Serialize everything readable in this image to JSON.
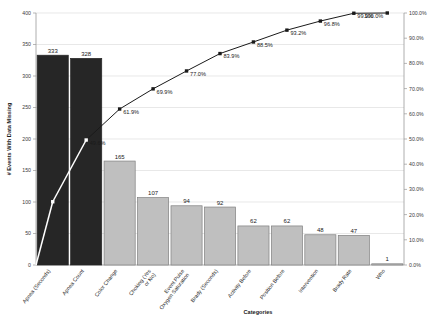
{
  "chart_data": {
    "type": "bar",
    "title": "",
    "xlabel": "Categories",
    "ylabel": "# Events With Data Missing",
    "y2label": "",
    "ylim": [
      0,
      400
    ],
    "y2lim": [
      0,
      100
    ],
    "grid": true,
    "legend": "none",
    "categories": [
      "Apnea (Seconds)",
      "Apnea Count",
      "Color Change",
      "Choking (Yes or No)",
      "Event Pulse Oxygen Saturation",
      "Brady (Seconds)",
      "Activity Before",
      "Position Before",
      "Intervention",
      "Brady Rate",
      "Who"
    ],
    "values": [
      333,
      328,
      165,
      107,
      94,
      92,
      62,
      62,
      48,
      47,
      1
    ],
    "bar_labels": [
      "333",
      "328",
      "165",
      "107",
      "94",
      "92",
      "62",
      "62",
      "48",
      "47",
      "1"
    ],
    "cumulative_percent": [
      25.1,
      49.6,
      61.9,
      69.9,
      77.0,
      83.9,
      88.5,
      93.2,
      96.8,
      99.9,
      100.0
    ],
    "cumulative_labels": [
      "",
      "49.6%",
      "61.9%",
      "69.9%",
      "77.0%",
      "83.9%",
      "88.5%",
      "93.2%",
      "96.8%",
      "99.9%",
      "100.0%"
    ],
    "y_ticks": [
      "0",
      "50",
      "100",
      "150",
      "200",
      "250",
      "300",
      "350",
      "400"
    ],
    "y2_ticks": [
      "0.0%",
      "10.0%",
      "20.0%",
      "30.0%",
      "40.0%",
      "50.0%",
      "60.0%",
      "70.0%",
      "80.0%",
      "90.0%",
      "100.0%"
    ],
    "colors": {
      "bar_dark": "#262626",
      "bar_light": "#bfbfbf",
      "bar_border": "#808080",
      "line": "#1a1a1a",
      "line_highlight": "#ffffff",
      "grid": "#d9d9d9",
      "axis": "#9a9a9a",
      "text": "#1a1a1a"
    },
    "dark_bar_count": 2
  }
}
